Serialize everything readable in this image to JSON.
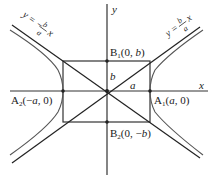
{
  "diagram": {
    "type": "hyperbola",
    "axes": {
      "x_label": "x",
      "y_label": "y"
    },
    "asymptote_positive": {
      "prefix": "y = ",
      "num": "b",
      "den": "a",
      "var": "x"
    },
    "asymptote_negative": {
      "prefix": "y = −",
      "num": "b",
      "den": "a",
      "var": "x"
    },
    "vertices": {
      "A1": {
        "name": "A",
        "sub": "1",
        "coords_open": "(",
        "coord1": "a",
        "sep": ", 0)"
      },
      "A2": {
        "name": "A",
        "sub": "2",
        "coords_open": "(−",
        "coord1": "a",
        "sep": ", 0)"
      }
    },
    "covertices": {
      "B1": {
        "name": "B",
        "sub": "1",
        "coords_open": "(0, ",
        "coord1": "b",
        "sep": ")"
      },
      "B2": {
        "name": "B",
        "sub": "2",
        "coords_open": "(0, −",
        "coord1": "b",
        "sep": ")"
      }
    },
    "segment_labels": {
      "semi_minor": "b",
      "semi_major": "a"
    },
    "colors": {
      "axes": "#333333",
      "curve": "#555555",
      "asymptote": "#222222"
    }
  }
}
